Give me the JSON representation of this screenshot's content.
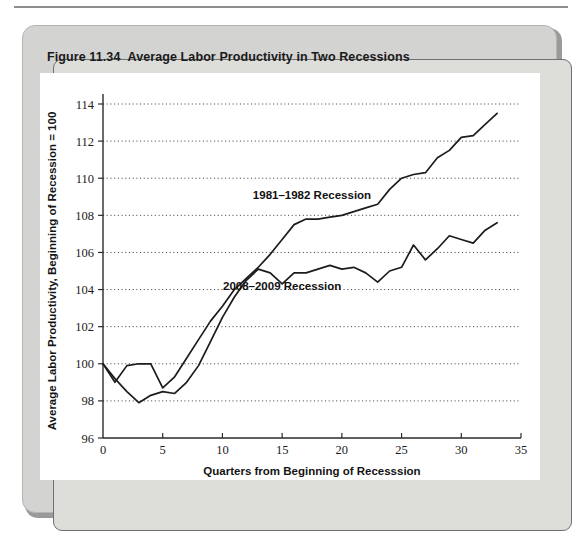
{
  "figure": {
    "number": "Figure 11.34",
    "title": "Average Labor Productivity in Two Recessions"
  },
  "chart_data": {
    "type": "line",
    "title": "Average Labor Productivity in Two Recessions",
    "xlabel": "Quarters from Beginning of Recesssion",
    "ylabel": "Average Labor Productivity, Beginning of Recession = 100",
    "xlim": [
      0,
      35
    ],
    "ylim": [
      96,
      114
    ],
    "xticks": [
      0,
      5,
      10,
      15,
      20,
      25,
      30,
      35
    ],
    "yticks": [
      96,
      98,
      100,
      102,
      104,
      106,
      108,
      110,
      112,
      114
    ],
    "grid": "horizontal-dotted",
    "legend": "inline-annotations",
    "series": [
      {
        "name": "1981–1982 Recession",
        "label_x": 17.5,
        "label_y": 108.9,
        "x": [
          0,
          1,
          2,
          3,
          4,
          5,
          6,
          7,
          8,
          9,
          10,
          11,
          12,
          13,
          14,
          15,
          16,
          17,
          18,
          19,
          20,
          21,
          22,
          23,
          24,
          25,
          26,
          27,
          28,
          29,
          30,
          31,
          32,
          33
        ],
        "y": [
          100.0,
          99.0,
          99.9,
          100.0,
          100.0,
          98.7,
          99.3,
          100.3,
          101.3,
          102.3,
          103.1,
          104.0,
          104.6,
          105.2,
          105.9,
          106.7,
          107.5,
          107.8,
          107.8,
          107.9,
          108.0,
          108.2,
          108.4,
          108.6,
          109.4,
          110.0,
          110.2,
          110.3,
          111.1,
          111.5,
          112.2,
          112.3,
          112.9,
          113.5
        ]
      },
      {
        "name": "2008–2009 Recession",
        "label_x": 15.0,
        "label_y": 104.0,
        "x": [
          0,
          1,
          2,
          3,
          4,
          5,
          6,
          7,
          8,
          9,
          10,
          11,
          12,
          13,
          14,
          15,
          16,
          17,
          18,
          19,
          20,
          21,
          22,
          23,
          24,
          25,
          26,
          27,
          28,
          29,
          30,
          31,
          32,
          33
        ],
        "y": [
          100.0,
          99.2,
          98.5,
          97.9,
          98.3,
          98.5,
          98.4,
          99.0,
          99.9,
          101.2,
          102.5,
          103.6,
          104.5,
          105.1,
          104.9,
          104.3,
          104.9,
          104.9,
          105.1,
          105.3,
          105.1,
          105.2,
          104.9,
          104.4,
          105.0,
          105.2,
          106.4,
          105.6,
          106.2,
          106.9,
          106.7,
          106.5,
          107.2,
          107.6
        ]
      }
    ]
  }
}
